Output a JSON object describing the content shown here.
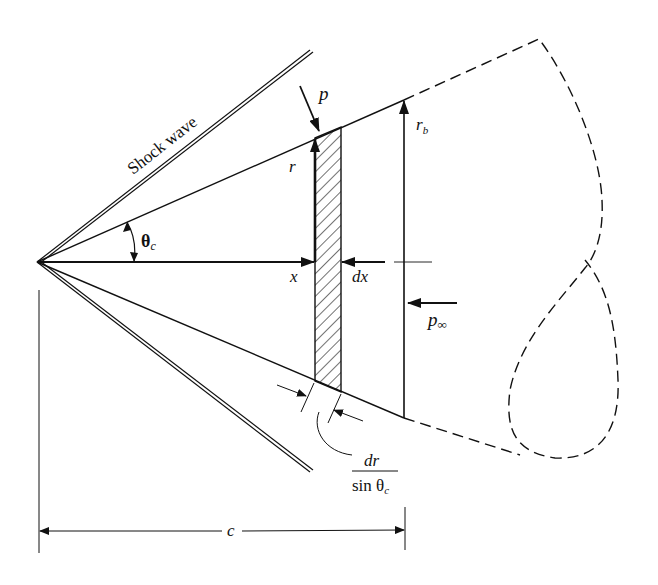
{
  "figure": {
    "type": "cone-in-supersonic-flow",
    "labels": {
      "shock_wave": "Shock wave",
      "pressure": "p",
      "radius": "r",
      "base_radius": "r",
      "base_radius_sub": "b",
      "cone_angle": "θ",
      "cone_angle_sub": "c",
      "x_axis": "x",
      "dx": "dx",
      "freestream_pressure": "p",
      "freestream_pressure_sub": "∞",
      "slant_numerator": "dr",
      "slant_denominator": "sin θ",
      "slant_denominator_sub": "c",
      "length": "c"
    },
    "colors": {
      "ink": "#111111",
      "background": "#ffffff"
    }
  }
}
